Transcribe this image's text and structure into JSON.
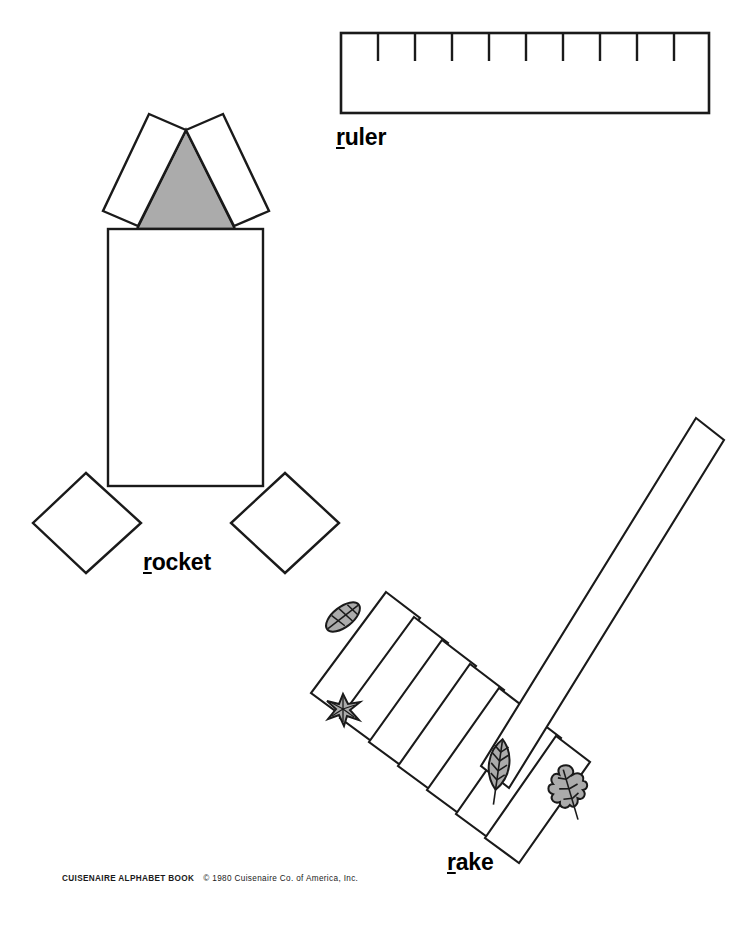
{
  "page": {
    "background_color": "#ffffff",
    "ink_color": "#1a1a1a",
    "fill_gray": "#ababab",
    "width": 750,
    "height": 929
  },
  "footer": {
    "title": "CUISENAIRE ALPHABET BOOK",
    "copyright": "© 1980 Cuisenaire Co. of America, Inc."
  },
  "items": [
    {
      "id": "ruler",
      "label_first_letter": "r",
      "label_rest": "uler",
      "tick_count": 9
    },
    {
      "id": "rocket",
      "label_first_letter": "r",
      "label_rest": "ocket",
      "nose_cone_fill": "#ababab",
      "fin_count": 2
    },
    {
      "id": "rake",
      "label_first_letter": "r",
      "label_rest": "ake",
      "tine_count": 6,
      "debris": [
        {
          "name": "leaf-veined",
          "fill": "#ababab"
        },
        {
          "name": "burr-star",
          "fill": "#ababab"
        },
        {
          "name": "leaf-pointed",
          "fill": "#ababab"
        },
        {
          "name": "leaf-oak",
          "fill": "#ababab"
        }
      ]
    }
  ]
}
